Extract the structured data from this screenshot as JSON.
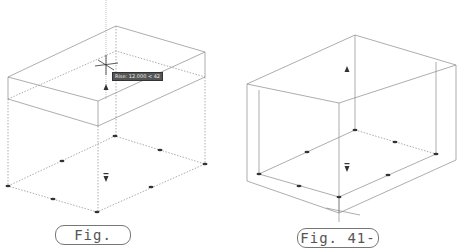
{
  "figures": [
    {
      "label": "Fig. 41-9",
      "tooltip": "Rise: 12.000 < 42"
    },
    {
      "label": "Fig. 41-10"
    }
  ],
  "colors": {
    "line": "#8a8a8a",
    "grip": "#333333",
    "label_border": "#777777",
    "label_text": "#555555"
  }
}
